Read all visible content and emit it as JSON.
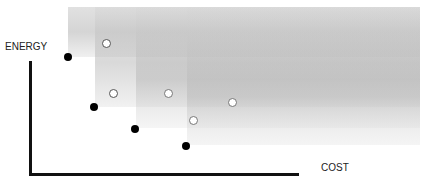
{
  "labels": {
    "y_axis": "ENERGY",
    "x_axis": "COST"
  },
  "regions": [
    {
      "id": "region-1",
      "x": 68,
      "y_bottom": 57
    },
    {
      "id": "region-2",
      "x": 95,
      "y_bottom": 107
    },
    {
      "id": "region-3",
      "x": 136,
      "y_bottom": 128
    },
    {
      "id": "region-4",
      "x": 187,
      "y_bottom": 145
    }
  ],
  "pareto_points": [
    {
      "x": 68,
      "y": 57
    },
    {
      "x": 94,
      "y": 107
    },
    {
      "x": 135,
      "y": 129
    },
    {
      "x": 186,
      "y": 146
    }
  ],
  "dominated_points": [
    {
      "x": 107,
      "y": 44
    },
    {
      "x": 114,
      "y": 94
    },
    {
      "x": 169,
      "y": 94
    },
    {
      "x": 194,
      "y": 121
    },
    {
      "x": 233,
      "y": 103
    }
  ],
  "colors": {
    "axis": "#111111",
    "pareto_point": "#000000",
    "dominated_point_stroke": "#777777",
    "region_shade": "#bdbdbd"
  }
}
